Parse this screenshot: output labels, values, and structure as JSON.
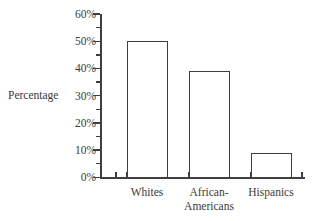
{
  "chart_data": {
    "type": "bar",
    "title": "",
    "xlabel": "",
    "ylabel": "Percentage",
    "categories": [
      "Whites",
      "African-\nAmericans",
      "Hispanics"
    ],
    "values": [
      50,
      39,
      9
    ],
    "ylim": [
      0,
      60
    ],
    "ytick_labels": [
      "0%",
      "10%",
      "20%",
      "30%",
      "40%",
      "50%",
      "60%"
    ],
    "ytick_values": [
      0,
      10,
      20,
      30,
      40,
      50,
      60
    ],
    "yminor_tick_values": [
      5,
      15,
      25,
      35,
      45,
      55
    ],
    "grid": false,
    "legend": false,
    "bar_fill_color": "#ffffff",
    "bar_outline_color": "#3f3f3f",
    "axis_color": "#3f3f3f",
    "background_color": "#ffffff",
    "text_color": "#3a3a3a"
  }
}
